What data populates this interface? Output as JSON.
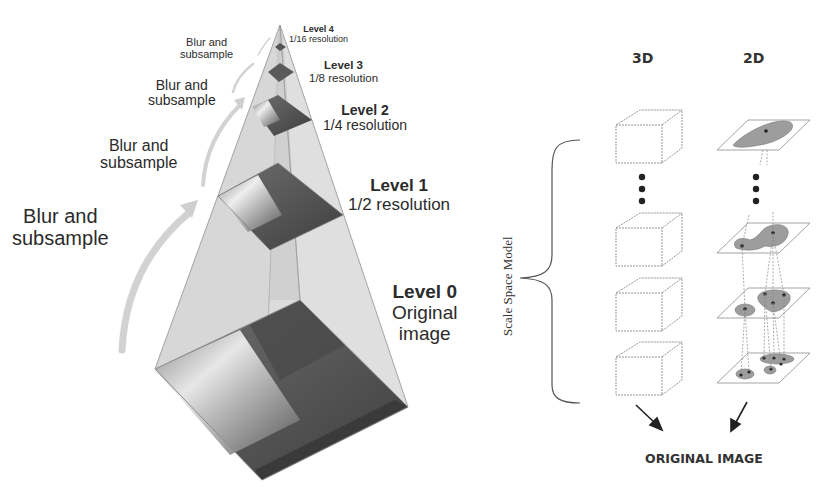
{
  "left_panel": {
    "title": "Image pyramid",
    "blur_labels": [
      {
        "line1": "Blur and",
        "line2": "subsample"
      },
      {
        "line1": "Blur and",
        "line2": "subsample"
      },
      {
        "line1": "Blur and",
        "line2": "subsample"
      },
      {
        "line1": "Blur and",
        "line2": "subsample"
      }
    ],
    "levels": [
      {
        "name": "Level 0",
        "desc_line1": "Original",
        "desc_line2": "image"
      },
      {
        "name": "Level 1",
        "desc": "1/2 resolution"
      },
      {
        "name": "Level 2",
        "desc": "1/4 resolution"
      },
      {
        "name": "Level 3",
        "desc": "1/8 resolution"
      },
      {
        "name": "Level 4",
        "desc": "1/16 resolution"
      }
    ]
  },
  "right_panel": {
    "vertical_label": "Scale Space Model",
    "column_headers": [
      "3D",
      "2D"
    ],
    "ellipsis": "⋮",
    "footer": "ORIGINAL IMAGE"
  },
  "colors": {
    "pyramid_fill": "#d9d9d9",
    "pyramid_edge": "#9a9a9a",
    "image_dark": "#555555",
    "image_light": "#e6e6e6",
    "blob_fill": "#9d9d9d",
    "line": "#777777",
    "text": "#2b2b2b"
  }
}
